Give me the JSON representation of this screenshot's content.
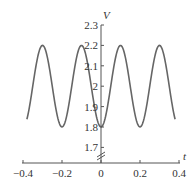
{
  "chart_data": {
    "type": "line",
    "title": "",
    "xlabel": "t",
    "ylabel": "V",
    "xlim": [
      -0.4,
      0.4
    ],
    "ylim": [
      1.65,
      2.3
    ],
    "x_ticks": [
      "−0.4",
      "−0.2",
      "0",
      "0.2",
      "0.4"
    ],
    "x_tick_values": [
      -0.4,
      -0.2,
      0,
      0.2,
      0.4
    ],
    "y_ticks": [
      "1.7",
      "1.8",
      "1.9",
      "2",
      "2.1",
      "2.2",
      "2.3"
    ],
    "y_tick_values": [
      1.7,
      1.8,
      1.9,
      2.0,
      2.1,
      2.2,
      2.3
    ],
    "grid": false,
    "legend": null,
    "y_axis_break": true,
    "series": [
      {
        "name": "V(t)",
        "description": "V = 2 - 0.2 cos(10πt), period 0.2, min 1.8 at t=0, max 2.2 at t=±0.1, ±0.3",
        "x": [
          -0.38,
          -0.35,
          -0.3,
          -0.25,
          -0.2,
          -0.15,
          -0.1,
          -0.05,
          0,
          0.05,
          0.1,
          0.15,
          0.2,
          0.25,
          0.3,
          0.35,
          0.38
        ],
        "values": [
          1.8,
          1.94,
          2.2,
          2.0,
          1.8,
          2.0,
          2.2,
          2.0,
          1.8,
          2.0,
          2.2,
          2.0,
          1.8,
          2.0,
          2.2,
          1.94,
          1.8
        ],
        "color": "#666666"
      }
    ]
  }
}
